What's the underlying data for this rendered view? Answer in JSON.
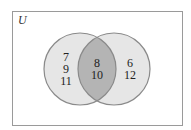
{
  "universe_label": "U",
  "colors": {
    "circle_fill": "#e6e6e6",
    "intersection_fill": "#b4b4b4",
    "stroke": "#8a8a8a",
    "border": "#9a9a9a"
  },
  "regions": {
    "left_only": [
      "7",
      "9",
      "11"
    ],
    "intersection": [
      "8",
      "10"
    ],
    "right_only": [
      "6",
      "12"
    ]
  }
}
